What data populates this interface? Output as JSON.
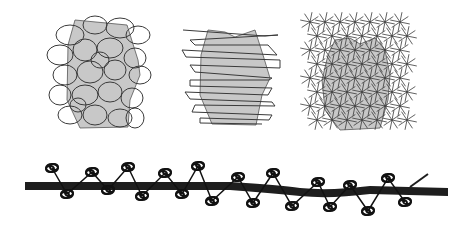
{
  "figure": {
    "width": 471,
    "height": 231,
    "background": "#ffffff",
    "fill_color": "#c8c8c8",
    "stroke_color": "#3a3a3a",
    "bar_color": "#1e1e1e",
    "panels": [
      {
        "id": "random-coil",
        "description": "gray block wrapped in random loops"
      },
      {
        "id": "horizontal-wrap",
        "description": "gray block wrapped in horizontal zigzag loops"
      },
      {
        "id": "star-lattice",
        "description": "gray block covered by a lattice of star crosses"
      }
    ],
    "bottom": {
      "description": "thick horizontal bar with coiled loops attached alternately above and below",
      "coils": 16
    }
  }
}
